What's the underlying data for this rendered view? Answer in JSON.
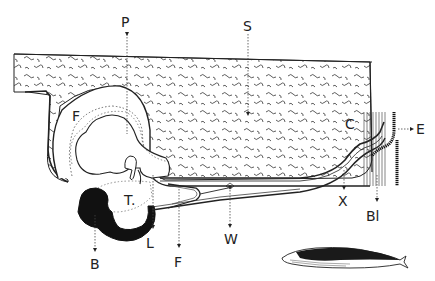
{
  "diagram": {
    "labels": {
      "P": "P",
      "S": "S",
      "F_upper": "F",
      "F_lower": "F",
      "C": "C",
      "E": "E",
      "T": "T.",
      "L": "L",
      "B": "B",
      "W": "W",
      "X": "X",
      "Bl": "Bl"
    },
    "colors": {
      "ink": "#1a1a1a",
      "paper": "#ffffff"
    }
  }
}
